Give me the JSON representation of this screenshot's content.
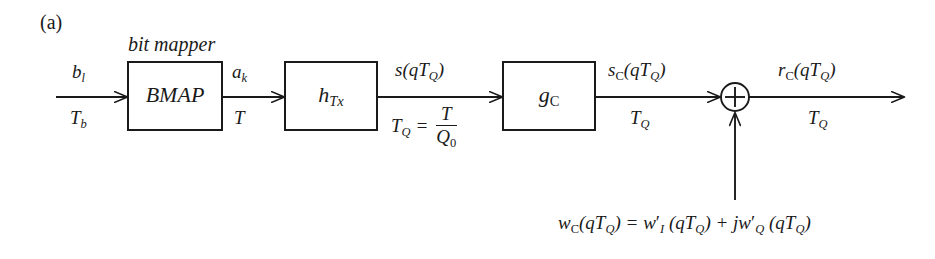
{
  "figure": {
    "panel_label": "(a)",
    "background_color": "#ffffff",
    "stroke_color": "#1a1a1a"
  },
  "caption": {
    "bit_mapper": "bit mapper"
  },
  "blocks": [
    {
      "id": "bmap",
      "label": "BMAP",
      "x": 128,
      "y": 62,
      "w": 94,
      "h": 68
    },
    {
      "id": "htx",
      "label": "h_Tx",
      "x": 285,
      "y": 62,
      "w": 92,
      "h": 68
    },
    {
      "id": "gc",
      "label": "g_C",
      "x": 503,
      "y": 62,
      "w": 92,
      "h": 68
    }
  ],
  "signals": {
    "input_top": "b_l",
    "input_bottom": "T_b",
    "bmap_out_top": "a_k",
    "bmap_out_bottom": "T",
    "htx_out_top": "s(qT_Q)",
    "htx_out_bottom_lhs": "T_Q =",
    "htx_out_bottom_num": "T",
    "htx_out_bottom_den": "Q_0",
    "gc_out_top": "s_C(qT_Q)",
    "gc_out_bottom": "T_Q",
    "sum_out_top": "r_C(qT_Q)",
    "sum_out_bottom": "T_Q"
  },
  "adder": {
    "symbol": "plus",
    "cx": 735,
    "cy": 97,
    "r": 14
  },
  "noise": {
    "equation": "w_C(qT_Q) = w'_I (qT_Q) + jw'_Q (qT_Q)",
    "lhs": "w_C(qT_Q)",
    "equals": "=",
    "term1": "w'_I (qT_Q)",
    "plus": "+",
    "term2": "jw'_Q (qT_Q)"
  },
  "icons": {
    "arrow": "arrow-right-icon",
    "arrow_up": "arrow-up-icon",
    "adder": "circle-plus-icon"
  }
}
